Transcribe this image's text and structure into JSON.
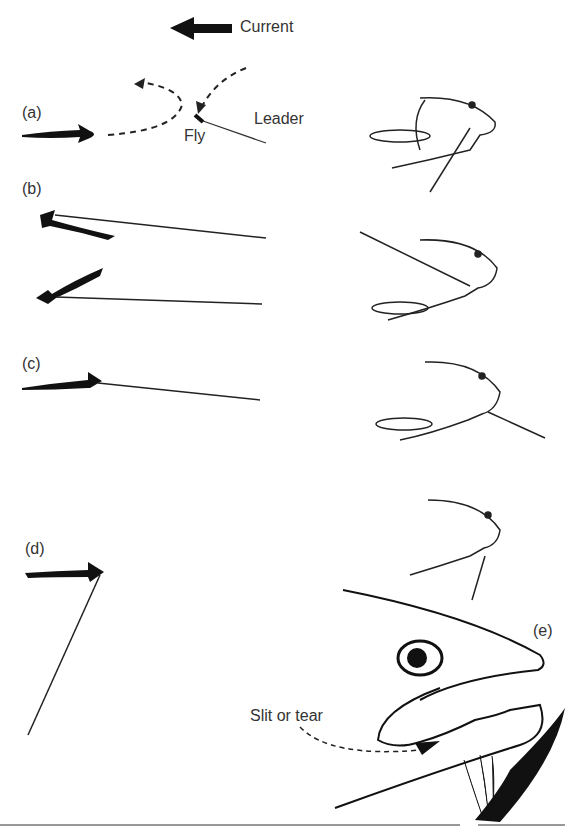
{
  "figure": {
    "current_label": "Current",
    "panels": [
      {
        "id": "a",
        "label": "(a)",
        "fly_label": "Fly",
        "leader_label": "Leader"
      },
      {
        "id": "b",
        "label": "(b)"
      },
      {
        "id": "c",
        "label": "(c)"
      },
      {
        "id": "d",
        "label": "(d)"
      },
      {
        "id": "e",
        "label": "(e)",
        "callout": "Slit or tear"
      }
    ]
  }
}
